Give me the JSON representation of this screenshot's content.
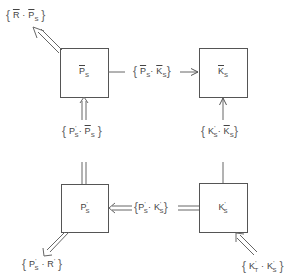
{
  "diagram": {
    "nodes": [
      {
        "id": "Pbar_s",
        "base": "P",
        "bar": true,
        "prime": false,
        "sub": "S",
        "x": 60,
        "y": 48,
        "w": 48,
        "h": 49
      },
      {
        "id": "Kbar_s",
        "base": "K",
        "bar": true,
        "prime": false,
        "sub": "S",
        "x": 199,
        "y": 48,
        "w": 48,
        "h": 49
      },
      {
        "id": "Pprime_s",
        "base": "P",
        "bar": false,
        "prime": true,
        "sub": "S",
        "x": 61,
        "y": 184,
        "w": 47,
        "h": 48
      },
      {
        "id": "Kprime_s",
        "base": "K",
        "bar": false,
        "prime": true,
        "sub": "S",
        "x": 199,
        "y": 183,
        "w": 48,
        "h": 49
      }
    ],
    "edges": [
      {
        "from": "Pbar_s",
        "to": "out_top_left",
        "style": "double",
        "label": "{R̄ · P̄S}"
      },
      {
        "from": "Pbar_s",
        "to": "Kbar_s",
        "style": "single",
        "label": "{P̄S · K̄S}"
      },
      {
        "from": "Pprime_s",
        "to": "Pbar_s",
        "style": "double",
        "label": "{P'S · P̄S}"
      },
      {
        "from": "Kprime_s",
        "to": "Kbar_s",
        "style": "single",
        "label": "{K'S · K̄S}"
      },
      {
        "from": "Kprime_s",
        "to": "Pprime_s",
        "style": "double",
        "label": "{P'S · K'S}"
      },
      {
        "from": "Pprime_s",
        "to": "out_bottom_left",
        "style": "double",
        "label": "{P'S · R'}"
      },
      {
        "from": "in_bottom_right",
        "to": "Kprime_s",
        "style": "double",
        "label": "{K'T · K'S}"
      }
    ]
  },
  "nodes": {
    "pbar": {
      "base": "P",
      "sub": "S"
    },
    "kbar": {
      "base": "K",
      "sub": "S"
    },
    "pprime": {
      "base": "P",
      "prime": "'",
      "sub": "S"
    },
    "kprime": {
      "base": "K",
      "prime": "'",
      "sub": "S"
    }
  },
  "labels": {
    "r_pbar": {
      "open": "{",
      "a": "R",
      "dot": " · ",
      "b": "P",
      "b_sub": "S",
      "close": "}"
    },
    "pbar_kbar": {
      "open": "{",
      "a": "P",
      "a_sub": "S",
      "dot": "· ",
      "b": "K",
      "b_sub": "S",
      "close": "}"
    },
    "pprime_pbar": {
      "open": "{",
      "a": "P",
      "a_prime": "'",
      "a_sub": "S",
      "dot": "· ",
      "b": "P",
      "b_sub": "S",
      "close": "}"
    },
    "kprime_kbar": {
      "open": "{",
      "a": "K",
      "a_prime": "'",
      "a_sub": "S",
      "dot": "· ",
      "b": "K",
      "b_sub": "S",
      "close": "}"
    },
    "pprime_kprime": {
      "open": "{",
      "a": "P",
      "a_prime": "'",
      "a_sub": "S",
      "dot": "· ",
      "b": "K",
      "b_prime": "'",
      "b_sub": "S",
      "close": "}"
    },
    "pprime_r": {
      "open": "{",
      "a": "P",
      "a_prime": "'",
      "a_sub": "S",
      "dot": " · ",
      "b": "R",
      "b_prime": "'",
      "close": "}"
    },
    "kt_kprime": {
      "open": "{",
      "a": "K",
      "a_prime": "'",
      "a_sub": "T",
      "dot": " · ",
      "b": "K",
      "b_prime": "'",
      "b_sub": "S",
      "close": "}"
    }
  }
}
